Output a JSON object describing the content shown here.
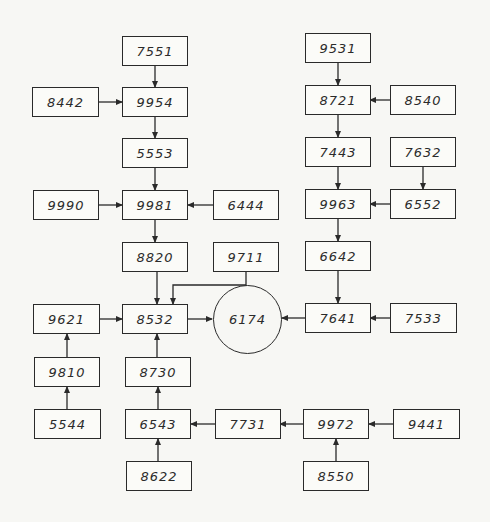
{
  "diagram": {
    "type": "block-flow",
    "nodes": {
      "n7551": "7551",
      "n9954": "9954",
      "n8442": "8442",
      "n5553": "5553",
      "n9990": "9990",
      "n9981": "9981",
      "n6444": "6444",
      "n8820": "8820",
      "n9711": "9711",
      "n9621": "9621",
      "n8532": "8532",
      "n6174": "6174",
      "n9810": "9810",
      "n8730": "8730",
      "n5544": "5544",
      "n6543": "6543",
      "n7731": "7731",
      "n8622": "8622",
      "n9531": "9531",
      "n8721": "8721",
      "n8540": "8540",
      "n7443": "7443",
      "n7632": "7632",
      "n9963": "9963",
      "n6552": "6552",
      "n6642": "6642",
      "n7641": "7641",
      "n7533": "7533",
      "n9972": "9972",
      "n9441": "9441",
      "n8550": "8550"
    },
    "edges": [
      [
        "7551",
        "9954"
      ],
      [
        "8442",
        "9954"
      ],
      [
        "9954",
        "5553"
      ],
      [
        "5553",
        "9981"
      ],
      [
        "9990",
        "9981"
      ],
      [
        "6444",
        "9981"
      ],
      [
        "9981",
        "8820"
      ],
      [
        "8820",
        "8532"
      ],
      [
        "9711",
        "8532"
      ],
      [
        "9621",
        "8532"
      ],
      [
        "8730",
        "8532"
      ],
      [
        "8532",
        "6174"
      ],
      [
        "9810",
        "9621"
      ],
      [
        "5544",
        "9810"
      ],
      [
        "6543",
        "8730"
      ],
      [
        "8622",
        "6543"
      ],
      [
        "7731",
        "6543"
      ],
      [
        "9972",
        "7731"
      ],
      [
        "9441",
        "9972"
      ],
      [
        "8550",
        "9972"
      ],
      [
        "9531",
        "8721"
      ],
      [
        "8540",
        "8721"
      ],
      [
        "8721",
        "7443"
      ],
      [
        "7443",
        "9963"
      ],
      [
        "7632",
        "6552"
      ],
      [
        "6552",
        "9963"
      ],
      [
        "9963",
        "6642"
      ],
      [
        "6642",
        "7641"
      ],
      [
        "7533",
        "7641"
      ],
      [
        "7641",
        "6174"
      ]
    ]
  }
}
